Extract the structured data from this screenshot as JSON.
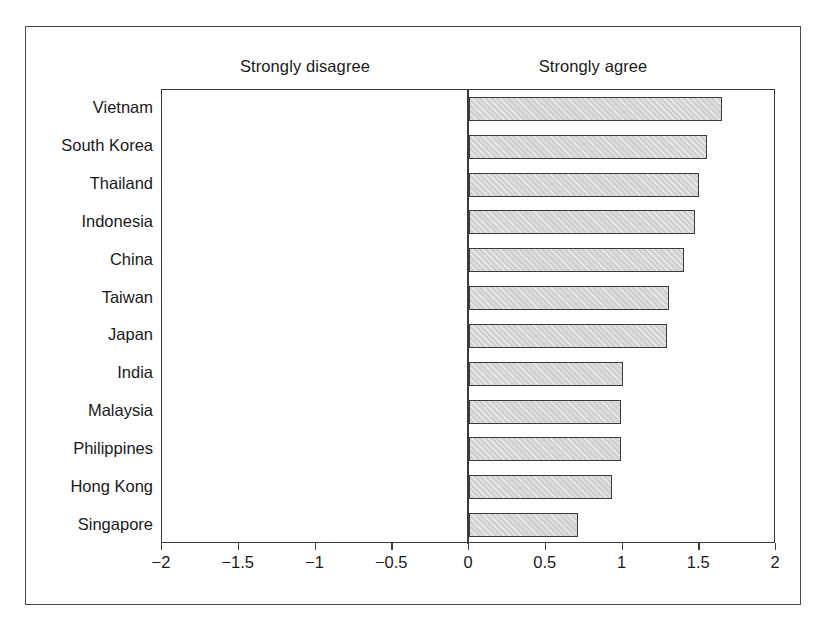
{
  "figure": {
    "header_left": "Strongly disagree",
    "header_right": "Strongly agree"
  },
  "axis": {
    "ticks": [
      {
        "label": "−2",
        "value": -2
      },
      {
        "label": "−1.5",
        "value": -1.5
      },
      {
        "label": "−1",
        "value": -1
      },
      {
        "label": "−0.5",
        "value": -0.5
      },
      {
        "label": "0",
        "value": 0
      },
      {
        "label": "0.5",
        "value": 0.5
      },
      {
        "label": "1",
        "value": 1
      },
      {
        "label": "1.5",
        "value": 1.5
      },
      {
        "label": "2",
        "value": 2
      }
    ]
  },
  "colors": {
    "bar_fill": "#d2d2d2",
    "bar_border": "#3b3b3b",
    "frame": "#4a4a4a",
    "text": "#1a1a1a",
    "background": "#ffffff"
  },
  "chart_data": {
    "type": "bar",
    "orientation": "horizontal",
    "title": "",
    "subtitle": "",
    "xlabel": "",
    "ylabel": "",
    "xlim": [
      -2,
      2
    ],
    "grid": false,
    "legend": null,
    "annotations": [
      "Strongly disagree",
      "Strongly agree"
    ],
    "xticks": [
      -2,
      -1.5,
      -1,
      -0.5,
      0,
      0.5,
      1,
      1.5,
      2
    ],
    "xticklabels": [
      "−2",
      "−1.5",
      "−1",
      "−0.5",
      "0",
      "0.5",
      "1",
      "1.5",
      "2"
    ],
    "categories": [
      "Vietnam",
      "South Korea",
      "Thailand",
      "Indonesia",
      "China",
      "Taiwan",
      "Japan",
      "India",
      "Malaysia",
      "Philippines",
      "Hong Kong",
      "Singapore"
    ],
    "values": [
      1.65,
      1.55,
      1.5,
      1.47,
      1.4,
      1.3,
      1.29,
      1.0,
      0.99,
      0.99,
      0.93,
      0.71
    ]
  }
}
